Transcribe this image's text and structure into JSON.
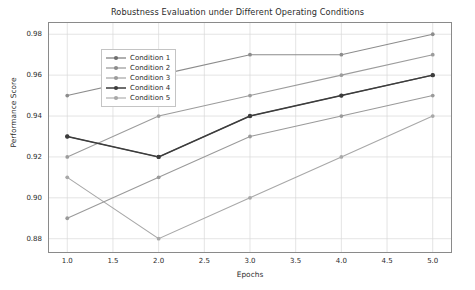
{
  "chart_data": {
    "type": "line",
    "title": "Robustness Evaluation under Different Operating Conditions",
    "xlabel": "Epochs",
    "ylabel": "Performance Score",
    "x": [
      1.0,
      2.0,
      3.0,
      4.0,
      5.0
    ],
    "xlim": [
      0.8,
      5.2
    ],
    "ylim": [
      0.8735,
      0.9855
    ],
    "xticks": [
      "1.0",
      "1.5",
      "2.0",
      "2.5",
      "3.0",
      "3.5",
      "4.0",
      "4.5",
      "5.0"
    ],
    "xtick_values": [
      1.0,
      1.5,
      2.0,
      2.5,
      3.0,
      3.5,
      4.0,
      4.5,
      5.0
    ],
    "yticks": [
      "0.88",
      "0.90",
      "0.92",
      "0.94",
      "0.96",
      "0.98"
    ],
    "ytick_values": [
      0.88,
      0.9,
      0.92,
      0.94,
      0.96,
      0.98
    ],
    "grid": true,
    "grid_color": "#d8d8d8",
    "legend_position": "upper left",
    "marker": "circle",
    "series": [
      {
        "name": "Condition 1",
        "color": "#6e6e6e",
        "width": 1.1,
        "values": [
          0.93,
          0.92,
          0.94,
          0.95,
          0.96
        ]
      },
      {
        "name": "Condition 2",
        "color": "#8c8c8c",
        "width": 1.1,
        "values": [
          0.95,
          0.96,
          0.97,
          0.97,
          0.98
        ]
      },
      {
        "name": "Condition 3",
        "color": "#9c9c9c",
        "width": 1.1,
        "values": [
          0.92,
          0.94,
          0.95,
          0.96,
          0.97
        ]
      },
      {
        "name": "Condition 4",
        "color": "#3c3c3c",
        "width": 1.5,
        "values": [
          0.93,
          0.92,
          0.94,
          0.95,
          0.96
        ]
      },
      {
        "name": "Condition 5",
        "color": "#a8a8a8",
        "width": 1.1,
        "values": [
          0.91,
          0.88,
          0.9,
          0.92,
          0.94
        ]
      },
      {
        "name": "Condition 6",
        "color": "#9a9a9a",
        "width": 1.1,
        "values": [
          0.89,
          0.91,
          0.93,
          0.94,
          0.95
        ]
      }
    ]
  },
  "legend": {
    "entries": [
      {
        "label": "Condition 1",
        "color": "#6e6e6e",
        "width": 1.1
      },
      {
        "label": "Condition 2",
        "color": "#8c8c8c",
        "width": 1.1
      },
      {
        "label": "Condition 3",
        "color": "#9c9c9c",
        "width": 1.1
      },
      {
        "label": "Condition 4",
        "color": "#3c3c3c",
        "width": 1.5
      },
      {
        "label": "Condition 5",
        "color": "#a8a8a8",
        "width": 1.1
      }
    ]
  }
}
